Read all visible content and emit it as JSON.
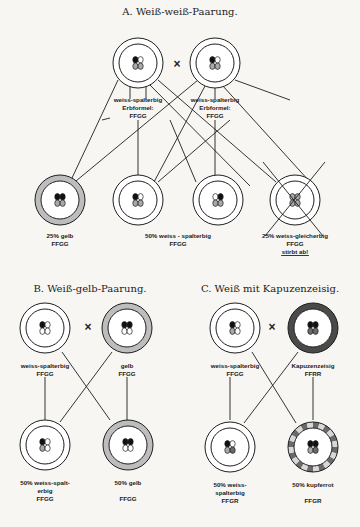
{
  "colors": {
    "ink": "#1e1e1e",
    "paper": "#f7f6f2",
    "white": "#ffffff",
    "yellow_ring": "#bdbdbd",
    "dark_ring": "#4a4a4a",
    "cell_black": "#111111",
    "cell_grey": "#a8a8a8",
    "cell_white": "#ffffff",
    "copper_light": "#d8d8d8",
    "copper_dark": "#6a6a6a"
  },
  "sections": [
    {
      "id": "A",
      "title": "A. Weiß-weiß-Paarung.",
      "title_pos": [
        180,
        15
      ],
      "cross_symbol": "×",
      "cross_pos": [
        177,
        68
      ],
      "parents": [
        {
          "cx": 138,
          "cy": 63,
          "ring": "white",
          "cells": [
            "black",
            "white",
            "grey",
            "grey"
          ],
          "label": [
            "weiss-spalterbig",
            "Erbformel:",
            "FFGG"
          ],
          "label_pos": [
            138,
            102
          ]
        },
        {
          "cx": 215,
          "cy": 63,
          "ring": "white",
          "cells": [
            "black",
            "white",
            "grey",
            "grey"
          ],
          "label": [
            "weiss-spalterbig",
            "Erbformel:",
            "FFGG"
          ],
          "label_pos": [
            215,
            102
          ]
        }
      ],
      "offspring": [
        {
          "cx": 60,
          "cy": 200,
          "ring": "yellow",
          "cells": [
            "black",
            "black",
            "grey",
            "grey"
          ],
          "label": [
            "25% gelb",
            "FFGG"
          ],
          "label_pos": [
            60,
            238
          ]
        },
        {
          "cx": 138,
          "cy": 200,
          "ring": "white",
          "cells": [
            "black",
            "white",
            "grey",
            "grey"
          ],
          "label": [],
          "label_pos": [
            138,
            238
          ]
        },
        {
          "cx": 218,
          "cy": 200,
          "ring": "white",
          "cells": [
            "white",
            "black",
            "grey",
            "grey"
          ],
          "label": [],
          "label_pos": [
            218,
            238
          ]
        },
        {
          "cx": 295,
          "cy": 200,
          "ring": "white",
          "cells": [
            "grey",
            "grey",
            "grey",
            "grey"
          ],
          "dead": true,
          "label": [
            "25% weiss-gleicherbig",
            "FFGG",
            "stirbt ab!"
          ],
          "label_pos": [
            295,
            238
          ]
        }
      ],
      "center_label": {
        "lines": [
          "50% weiss - spalterbig",
          "FFGG"
        ],
        "pos": [
          178,
          238
        ]
      },
      "lines": [
        [
          118,
          80,
          72,
          178
        ],
        [
          130,
          86,
          130,
          99
        ],
        [
          146,
          86,
          146,
          99
        ],
        [
          150,
          85,
          250,
          186
        ],
        [
          158,
          80,
          276,
          182
        ],
        [
          198,
          80,
          76,
          181
        ],
        [
          205,
          86,
          154,
          182
        ],
        [
          215,
          88,
          215,
          99
        ],
        [
          222,
          85,
          310,
          182
        ],
        [
          235,
          80,
          290,
          100
        ],
        [
          138,
          120,
          138,
          178
        ],
        [
          215,
          120,
          215,
          178
        ],
        [
          110,
          118,
          102,
          120
        ],
        [
          170,
          120,
          196,
          182
        ],
        [
          230,
          120,
          158,
          182
        ]
      ]
    },
    {
      "id": "B",
      "title": "B. Weiß-gelb-Paarung.",
      "title_pos": [
        90,
        292
      ],
      "cross_symbol": "×",
      "cross_pos": [
        88,
        331
      ],
      "parents": [
        {
          "cx": 45,
          "cy": 328,
          "ring": "white",
          "cells": [
            "black",
            "white",
            "white",
            "white"
          ],
          "label": [
            "weiss-spalterbig",
            "FFGG"
          ],
          "label_pos": [
            45,
            368
          ]
        },
        {
          "cx": 127,
          "cy": 328,
          "ring": "yellow",
          "cells": [
            "black",
            "black",
            "white",
            "white"
          ],
          "label": [
            "gelb",
            "FFGG"
          ],
          "label_pos": [
            127,
            368
          ]
        }
      ],
      "offspring": [
        {
          "cx": 45,
          "cy": 445,
          "ring": "white",
          "cells": [
            "black",
            "white",
            "grey",
            "white"
          ],
          "label": [
            "50% weiss-spalt-",
            "erbig",
            "FFGG"
          ],
          "label_pos": [
            45,
            485
          ]
        },
        {
          "cx": 128,
          "cy": 445,
          "ring": "yellow",
          "cells": [
            "black",
            "black",
            "white",
            "white"
          ],
          "label": [
            "50% gelb",
            "",
            "FFGG"
          ],
          "label_pos": [
            128,
            485
          ]
        }
      ],
      "lines": [
        [
          45,
          377,
          45,
          420
        ],
        [
          127,
          377,
          127,
          420
        ],
        [
          62,
          352,
          110,
          420
        ],
        [
          112,
          352,
          60,
          422
        ]
      ]
    },
    {
      "id": "C",
      "title": "C. Weiß mit Kapuzenzeisig.",
      "title_pos": [
        270,
        292
      ],
      "cross_symbol": "×",
      "cross_pos": [
        272,
        331
      ],
      "parents": [
        {
          "cx": 235,
          "cy": 328,
          "ring": "white",
          "cells": [
            "black",
            "white",
            "grey",
            "white"
          ],
          "label": [
            "weiss-spalterbig",
            "FFGG"
          ],
          "label_pos": [
            235,
            368
          ]
        },
        {
          "cx": 313,
          "cy": 328,
          "ring": "dark",
          "cells": [
            "black",
            "black",
            "dark",
            "dark"
          ],
          "label": [
            "Kapuzenzeisig",
            "FFRR"
          ],
          "label_pos": [
            313,
            368
          ]
        }
      ],
      "offspring": [
        {
          "cx": 230,
          "cy": 447,
          "ring": "white",
          "cells": [
            "black",
            "white",
            "grey",
            "dark"
          ],
          "label": [
            "50% weiss-",
            "spalterbig",
            "FFGR"
          ],
          "label_pos": [
            230,
            487
          ]
        },
        {
          "cx": 313,
          "cy": 447,
          "ring": "copper",
          "cells": [
            "black",
            "black",
            "grey",
            "dark"
          ],
          "label": [
            "50% kupferrot",
            "",
            "FFGR"
          ],
          "label_pos": [
            313,
            487
          ]
        }
      ],
      "lines": [
        [
          230,
          377,
          230,
          420
        ],
        [
          313,
          377,
          313,
          420
        ],
        [
          252,
          352,
          296,
          423
        ],
        [
          298,
          352,
          244,
          423
        ]
      ]
    }
  ]
}
